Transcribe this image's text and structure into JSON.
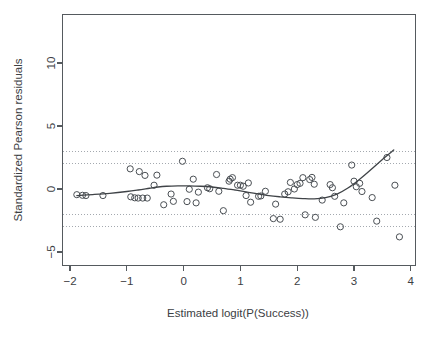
{
  "chart_data": {
    "type": "scatter",
    "title": "",
    "xlabel": "Estimated logit(P(Success))",
    "ylabel": "Standardized Pearson residuals",
    "xlim": [
      -2.15,
      4.05
    ],
    "ylim": [
      -6.2,
      12.5
    ],
    "xticks": [
      -2,
      -1,
      0,
      1,
      2,
      3,
      4
    ],
    "xtick_labels": [
      "−2",
      "−1",
      "0",
      "1",
      "2",
      "3",
      "4"
    ],
    "yticks": [
      -5,
      0,
      5,
      10
    ],
    "ytick_labels": [
      "−5",
      "0",
      "5",
      "10"
    ],
    "grid": false,
    "reference_lines": {
      "values": [
        3,
        2,
        -2,
        -3
      ],
      "style": "dotted",
      "color": "#9aa0a6"
    },
    "point_style": {
      "marker": "open-circle",
      "radius": 3.1,
      "color": "#4a4f54"
    },
    "points": [
      [
        -1.88,
        -0.45
      ],
      [
        -1.78,
        -0.5
      ],
      [
        -1.72,
        -0.52
      ],
      [
        -1.42,
        -0.52
      ],
      [
        -0.94,
        1.6
      ],
      [
        -0.93,
        -0.62
      ],
      [
        -0.86,
        -0.7
      ],
      [
        -0.8,
        -0.72
      ],
      [
        -0.78,
        1.38
      ],
      [
        -0.72,
        -0.72
      ],
      [
        -0.68,
        1.08
      ],
      [
        -0.64,
        -0.72
      ],
      [
        -0.52,
        0.3
      ],
      [
        -0.47,
        1.1
      ],
      [
        -0.35,
        -1.25
      ],
      [
        -0.22,
        -0.4
      ],
      [
        -0.18,
        -0.98
      ],
      [
        -0.02,
        2.2
      ],
      [
        0.06,
        -1.0
      ],
      [
        0.1,
        -0.02
      ],
      [
        0.17,
        0.78
      ],
      [
        0.22,
        -1.1
      ],
      [
        0.26,
        -0.25
      ],
      [
        0.42,
        0.1
      ],
      [
        0.46,
        0.02
      ],
      [
        0.58,
        1.15
      ],
      [
        0.62,
        -0.18
      ],
      [
        0.7,
        -1.72
      ],
      [
        0.8,
        0.62
      ],
      [
        0.82,
        0.78
      ],
      [
        0.86,
        0.9
      ],
      [
        0.95,
        0.3
      ],
      [
        1.0,
        0.3
      ],
      [
        1.05,
        0.22
      ],
      [
        1.1,
        -0.52
      ],
      [
        1.14,
        0.48
      ],
      [
        1.18,
        -1.05
      ],
      [
        1.32,
        -0.58
      ],
      [
        1.36,
        -0.55
      ],
      [
        1.44,
        -0.18
      ],
      [
        1.58,
        -2.35
      ],
      [
        1.62,
        -1.2
      ],
      [
        1.7,
        -2.4
      ],
      [
        1.78,
        -0.4
      ],
      [
        1.84,
        -0.22
      ],
      [
        1.88,
        0.52
      ],
      [
        1.95,
        0.0
      ],
      [
        2.0,
        0.35
      ],
      [
        2.05,
        0.45
      ],
      [
        2.1,
        0.9
      ],
      [
        2.14,
        -2.05
      ],
      [
        2.22,
        0.75
      ],
      [
        2.26,
        0.92
      ],
      [
        2.3,
        0.38
      ],
      [
        2.32,
        -2.25
      ],
      [
        2.44,
        -0.88
      ],
      [
        2.58,
        0.35
      ],
      [
        2.62,
        0.1
      ],
      [
        2.66,
        -0.58
      ],
      [
        2.76,
        -3.0
      ],
      [
        2.82,
        -1.1
      ],
      [
        2.96,
        1.9
      ],
      [
        3.0,
        0.62
      ],
      [
        3.04,
        0.18
      ],
      [
        3.1,
        0.45
      ],
      [
        3.14,
        -0.2
      ],
      [
        3.32,
        -0.68
      ],
      [
        3.4,
        -2.55
      ],
      [
        3.58,
        2.5
      ],
      [
        3.72,
        0.3
      ],
      [
        3.8,
        -3.8
      ]
    ],
    "smooth_curve": {
      "name": "lowess smoother",
      "x": [
        -1.88,
        -1.6,
        -1.3,
        -1.0,
        -0.8,
        -0.6,
        -0.45,
        -0.3,
        -0.1,
        0.1,
        0.3,
        0.5,
        0.7,
        0.9,
        1.1,
        1.3,
        1.5,
        1.7,
        1.9,
        2.1,
        2.3,
        2.5,
        2.7,
        2.9,
        3.1,
        3.3,
        3.5,
        3.7
      ],
      "y": [
        -0.52,
        -0.44,
        -0.34,
        -0.2,
        -0.08,
        0.06,
        0.16,
        0.22,
        0.25,
        0.25,
        0.22,
        0.16,
        0.05,
        -0.08,
        -0.22,
        -0.38,
        -0.52,
        -0.62,
        -0.7,
        -0.76,
        -0.78,
        -0.68,
        -0.4,
        0.1,
        0.78,
        1.55,
        2.35,
        3.1
      ]
    }
  }
}
